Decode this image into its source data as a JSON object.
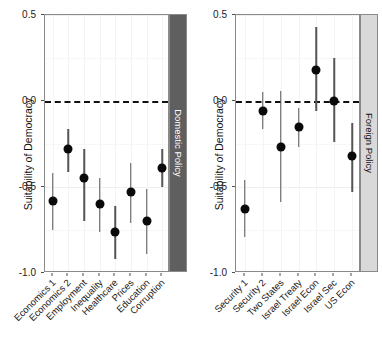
{
  "chart_data": {
    "type": "scatter",
    "title": "",
    "xlabel": "",
    "ylabel": "Suitability of Democracy",
    "ylim": [
      -1.0,
      0.5
    ],
    "yticks": [
      0.5,
      0.0,
      -0.5,
      -1.0
    ],
    "ytick_labels": [
      "0.5",
      "0.0",
      "-0.5",
      "-1.0"
    ],
    "grid": true,
    "legend": "none",
    "reference_line": 0.0,
    "reference_line_style": "dashed",
    "error_bars": "95% confidence interval",
    "panels": [
      {
        "strip_label": "Domestic Policy",
        "strip_color": "#5f5f5f",
        "strip_text_color": "#ffffff",
        "categories": [
          "Economics 1",
          "Economics 2",
          "Employment",
          "Inequality",
          "Healthcare",
          "Prices",
          "Education",
          "Corruption"
        ],
        "values": [
          -0.58,
          -0.28,
          -0.45,
          -0.6,
          -0.76,
          -0.53,
          -0.7,
          -0.39
        ],
        "ci_low": [
          -0.75,
          -0.41,
          -0.7,
          -0.76,
          -0.92,
          -0.71,
          -0.89,
          -0.5
        ],
        "ci_high": [
          -0.42,
          -0.16,
          -0.28,
          -0.45,
          -0.61,
          -0.36,
          -0.51,
          -0.28
        ]
      },
      {
        "strip_label": "Foreign Policy",
        "strip_color": "#d9d9d9",
        "strip_text_color": "#111111",
        "categories": [
          "Security 1",
          "Security 2",
          "Two States",
          "Israel Treaty",
          "Israel Econ",
          "Israel Sec",
          "US Econ"
        ],
        "values": [
          -0.63,
          -0.06,
          -0.27,
          -0.15,
          0.18,
          0.0,
          -0.32
        ],
        "ci_low": [
          -0.79,
          -0.16,
          -0.59,
          -0.27,
          -0.06,
          -0.24,
          -0.53
        ],
        "ci_high": [
          -0.46,
          0.05,
          0.06,
          -0.04,
          0.43,
          0.25,
          -0.13
        ]
      }
    ]
  },
  "axis": {
    "y_title": "Suitability of Democracy"
  }
}
